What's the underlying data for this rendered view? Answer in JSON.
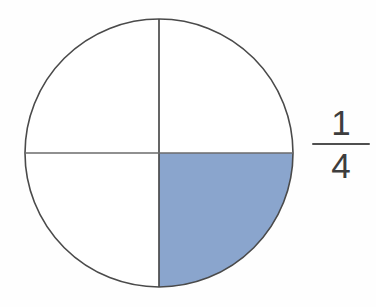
{
  "figure": {
    "shape": "circle",
    "divisions": 4,
    "shaded_parts": 1,
    "shaded_quadrant": "bottom-right",
    "circle": {
      "center_x": 159,
      "center_y": 153,
      "radius": 134,
      "outline_color": "#4a4a4a",
      "outline_width": 1.6,
      "fill_color": "#ffffff"
    },
    "divider_lines": [
      {
        "name": "vertical-diameter",
        "orientation": "vertical",
        "color": "#4a4a4a"
      },
      {
        "name": "horizontal-diameter",
        "orientation": "horizontal",
        "color": "#6b6b6b"
      }
    ],
    "shaded_fill_color": "#8aa5cd",
    "background_color": "#fefefe"
  },
  "fraction": {
    "numerator": "1",
    "denominator": "4",
    "bar_color": "#4f4f4f",
    "text_color": "#3d3d3d",
    "value": "1/4"
  }
}
